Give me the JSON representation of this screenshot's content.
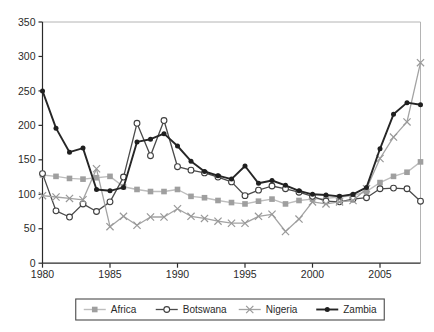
{
  "chart_data": {
    "type": "line",
    "title": "",
    "xlabel": "",
    "ylabel": "",
    "xlim": [
      1980,
      2008
    ],
    "ylim": [
      0,
      350
    ],
    "grid": false,
    "legend_position": "bottom",
    "x_ticks": [
      1980,
      1985,
      1990,
      1995,
      2000,
      2005
    ],
    "x_tick_labels": [
      "1980",
      "1985",
      "1990",
      "1995",
      "2000",
      "2005"
    ],
    "y_ticks": [
      0,
      50,
      100,
      150,
      200,
      250,
      300,
      350
    ],
    "y_tick_labels": [
      "0",
      "50",
      "100",
      "150",
      "200",
      "250",
      "300",
      "350"
    ],
    "x": [
      1980,
      1981,
      1982,
      1983,
      1984,
      1985,
      1986,
      1987,
      1988,
      1989,
      1990,
      1991,
      1992,
      1993,
      1994,
      1995,
      1996,
      1997,
      1998,
      1999,
      2000,
      2001,
      2002,
      2003,
      2004,
      2005,
      2006,
      2007,
      2008
    ],
    "series": [
      {
        "name": "Africa",
        "marker": "square",
        "color": "#9f9f9f",
        "line_color": "#bdbdbd",
        "line_width": 1.4,
        "values": [
          128,
          126,
          123,
          122,
          124,
          126,
          111,
          107,
          104,
          104,
          107,
          97,
          95,
          91,
          88,
          86,
          90,
          93,
          86,
          91,
          93,
          94,
          96,
          98,
          104,
          117,
          126,
          132,
          147
        ]
      },
      {
        "name": "Botswana",
        "marker": "circle-open",
        "color": "#3f3f3f",
        "line_color": "#4a4a4a",
        "line_width": 1.3,
        "values": [
          130,
          76,
          67,
          86,
          75,
          89,
          125,
          203,
          156,
          207,
          140,
          135,
          131,
          125,
          118,
          98,
          106,
          112,
          108,
          103,
          97,
          90,
          89,
          93,
          95,
          108,
          109,
          108,
          90
        ]
      },
      {
        "name": "Nigeria",
        "marker": "x",
        "color": "#999999",
        "line_color": "#a3a3a3",
        "line_width": 1.3,
        "values": [
          98,
          96,
          94,
          92,
          137,
          53,
          68,
          55,
          67,
          67,
          79,
          68,
          65,
          61,
          58,
          58,
          68,
          71,
          46,
          64,
          89,
          86,
          89,
          91,
          108,
          152,
          183,
          205,
          291
        ]
      },
      {
        "name": "Zambia",
        "marker": "circle-filled",
        "color": "#1f1f1f",
        "line_color": "#262626",
        "line_width": 1.9,
        "values": [
          250,
          196,
          161,
          167,
          107,
          105,
          110,
          176,
          180,
          188,
          170,
          148,
          133,
          127,
          122,
          141,
          116,
          120,
          113,
          105,
          100,
          99,
          97,
          100,
          110,
          166,
          216,
          233,
          230
        ]
      }
    ]
  }
}
